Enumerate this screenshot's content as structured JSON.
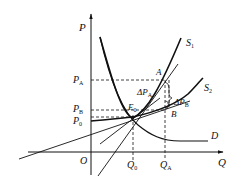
{
  "diagram": {
    "type": "supply-demand",
    "axes": {
      "y_label": "P",
      "x_label": "Q",
      "origin_label": "O"
    },
    "price_levels": [
      {
        "id": "PA",
        "label": "P",
        "sub": "A"
      },
      {
        "id": "PB",
        "label": "P",
        "sub": "B"
      },
      {
        "id": "P0",
        "label": "P",
        "sub": "0"
      }
    ],
    "quantity_levels": [
      {
        "id": "Q0",
        "label": "Q",
        "sub": "0"
      },
      {
        "id": "QA",
        "label": "Q",
        "sub": "A"
      }
    ],
    "curves": {
      "s1": {
        "label": "S",
        "sub": "1"
      },
      "s2": {
        "label": "S",
        "sub": "2"
      },
      "d": {
        "label": "D"
      }
    },
    "points": {
      "e0": {
        "label": "E",
        "sub": "0"
      },
      "a": {
        "label": "A"
      },
      "b": {
        "label": "B"
      }
    },
    "deltas": {
      "dpa": {
        "label": "ΔP",
        "sub": "A"
      },
      "dpb": {
        "label": "ΔP",
        "sub": "B"
      }
    },
    "colors": {
      "line": "#111111",
      "background": "#ffffff"
    }
  }
}
